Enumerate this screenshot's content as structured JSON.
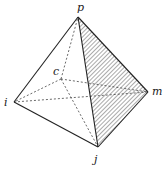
{
  "diagram": {
    "type": "pyramid",
    "vertices": {
      "p": {
        "label": "p",
        "x": 78,
        "y": 17
      },
      "c": {
        "label": "c",
        "x": 61,
        "y": 79
      },
      "i": {
        "label": "i",
        "x": 14,
        "y": 102
      },
      "m": {
        "label": "m",
        "x": 148,
        "y": 92
      },
      "j": {
        "label": "j",
        "x": 98,
        "y": 147
      }
    },
    "solid_edges": [
      [
        "p",
        "i"
      ],
      [
        "p",
        "j"
      ],
      [
        "p",
        "m"
      ],
      [
        "i",
        "j"
      ],
      [
        "j",
        "m"
      ]
    ],
    "dashed_edges": [
      [
        "c",
        "p"
      ],
      [
        "c",
        "i"
      ],
      [
        "c",
        "m"
      ],
      [
        "c",
        "j"
      ],
      [
        "i",
        "m"
      ]
    ],
    "shaded_face": [
      "p",
      "j",
      "m"
    ],
    "colors": {
      "line": "#222222",
      "hatch": "#555555",
      "background": "#ffffff"
    }
  }
}
